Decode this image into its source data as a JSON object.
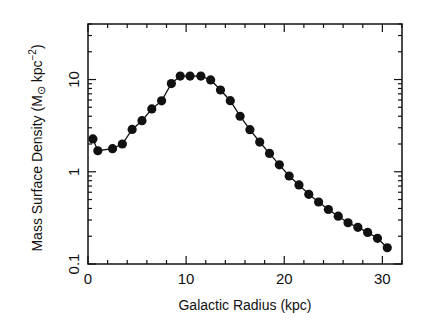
{
  "chart_data": {
    "type": "line",
    "title": "",
    "xlabel": "Galactic Radius (kpc)",
    "ylabel": "Mass Surface Density (M⊙ kpc⁻²)",
    "ylabel_parts": {
      "main": "Mass Surface Density (M",
      "sub": "⊙",
      "mid": " kpc",
      "sup": "−2",
      "end": ")"
    },
    "xscale": "linear",
    "yscale": "log",
    "xlim": [
      0,
      32
    ],
    "ylim": [
      0.1,
      40
    ],
    "x_ticks": [
      0,
      10,
      20,
      30
    ],
    "x_tick_labels": [
      "0",
      "10",
      "20",
      "30"
    ],
    "y_ticks": [
      0.1,
      1,
      10
    ],
    "y_tick_labels": [
      "0.1",
      "1",
      "10"
    ],
    "grid": false,
    "legend": null,
    "marker": "filled-circle",
    "series": [
      {
        "name": "Mass Surface Density",
        "x": [
          0.5,
          1.0,
          2.5,
          3.5,
          4.5,
          5.5,
          6.5,
          7.5,
          8.5,
          9.4,
          10.4,
          11.5,
          12.5,
          13.5,
          14.5,
          15.5,
          16.5,
          17.5,
          18.5,
          19.5,
          20.5,
          21.5,
          22.5,
          23.5,
          24.5,
          25.5,
          26.5,
          27.5,
          28.5,
          29.5,
          30.5
        ],
        "values": [
          2.27,
          1.69,
          1.78,
          2.0,
          2.88,
          3.58,
          4.8,
          5.87,
          9.05,
          10.9,
          10.9,
          10.9,
          9.9,
          7.7,
          5.9,
          4.0,
          2.86,
          2.1,
          1.58,
          1.19,
          0.9,
          0.72,
          0.57,
          0.47,
          0.39,
          0.33,
          0.28,
          0.25,
          0.22,
          0.19,
          0.15
        ]
      }
    ],
    "colors": {
      "line": "#111111",
      "marker": "#111111",
      "axes": "#111111",
      "background": "#ffffff"
    }
  },
  "plot_area": {
    "left": 88,
    "top": 24,
    "right": 402,
    "bottom": 264
  }
}
